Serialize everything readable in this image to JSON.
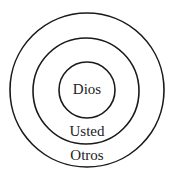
{
  "diagram": {
    "type": "concentric-circles",
    "stroke_color": "#1a1a1a",
    "rings": [
      {
        "label": "Dios",
        "level": "inner"
      },
      {
        "label": "Usted",
        "level": "middle"
      },
      {
        "label": "Otros",
        "level": "outer"
      }
    ]
  }
}
